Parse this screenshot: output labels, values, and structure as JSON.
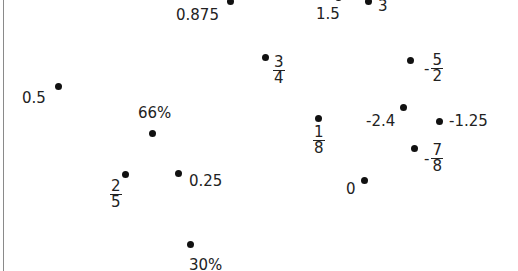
{
  "items": [
    {
      "id": "p0875",
      "text": "0.875"
    },
    {
      "id": "p15",
      "text": "1.5"
    },
    {
      "id": "p3",
      "text": "3"
    },
    {
      "id": "p34",
      "sign": "",
      "num": "3",
      "den": "4"
    },
    {
      "id": "pm52",
      "sign": "-",
      "num": "5",
      "den": "2"
    },
    {
      "id": "p05",
      "text": "0.5"
    },
    {
      "id": "p66",
      "text": "66%"
    },
    {
      "id": "p18",
      "sign": "",
      "num": "1",
      "den": "8"
    },
    {
      "id": "pm24",
      "text": "-2.4"
    },
    {
      "id": "pm125",
      "text": "-1.25"
    },
    {
      "id": "pm78",
      "sign": "-",
      "num": "7",
      "den": "8"
    },
    {
      "id": "p25",
      "sign": "",
      "num": "2",
      "den": "5"
    },
    {
      "id": "p025",
      "text": "0.25"
    },
    {
      "id": "p0",
      "text": "0"
    },
    {
      "id": "p30",
      "text": "30%"
    }
  ]
}
